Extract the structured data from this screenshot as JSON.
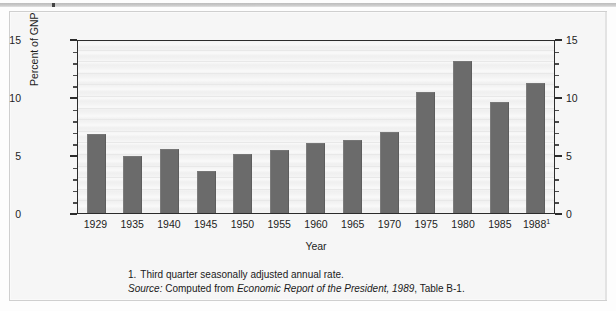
{
  "figure": {
    "axis_title_y": "Percent of GNP",
    "axis_title_x": "Year",
    "notes": {
      "footnote_marker": "1.",
      "footnote_text": "Third quarter seasonally adjusted annual rate.",
      "source_label": "Source:",
      "source_prefix": "Computed from",
      "source_italic": "Economic Report of the President, 1989",
      "source_suffix": ", Table B-1."
    }
  },
  "chart_data": {
    "type": "bar",
    "title": "",
    "xlabel": "Year",
    "ylabel": "Percent of GNP",
    "ylim": [
      0,
      15
    ],
    "yticks": [
      0,
      5,
      10,
      15
    ],
    "ytick_labels": [
      "0",
      "5",
      "10",
      "15"
    ],
    "ytick_labels_right": [
      "0",
      "5",
      "10",
      "15"
    ],
    "minor_tick_interval": 1,
    "grid": true,
    "legend": "none",
    "dual_axis": true,
    "categories": [
      "1929",
      "1935",
      "1940",
      "1945",
      "1950",
      "1955",
      "1960",
      "1965",
      "1970",
      "1975",
      "1980",
      "1985",
      "1988"
    ],
    "category_labels": [
      "1929",
      "1935",
      "1940",
      "1945",
      "1950",
      "1955",
      "1960",
      "1965",
      "1970",
      "1975",
      "1980",
      "1985",
      "1988¹"
    ],
    "category_footnote_index": 12,
    "values": [
      6.8,
      4.9,
      5.5,
      3.6,
      5.1,
      5.4,
      6.0,
      6.3,
      7.0,
      10.4,
      13.1,
      9.6,
      11.2
    ],
    "bar_color": "#6b6b6b",
    "plot_bg_color": "#f3f3f3",
    "axis_color": "#2c2c2c"
  }
}
